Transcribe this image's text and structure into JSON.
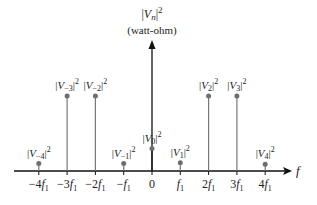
{
  "chart_data": {
    "type": "stem",
    "title": "",
    "ylabel": "|V_n|^2",
    "yunit": "(watt-ohm)",
    "xlabel": "f",
    "categories": [
      "-4f1",
      "-3f1",
      "-2f1",
      "-f1",
      "0",
      "f1",
      "2f1",
      "3f1",
      "4f1"
    ],
    "tick_labels": [
      "−4",
      "−3",
      "−2",
      "−",
      "0",
      "",
      "2",
      "3",
      "4"
    ],
    "point_labels": [
      "V−4",
      "V−3",
      "V−2",
      "V−1",
      "V0",
      "V1",
      "V2",
      "V3",
      "V4"
    ],
    "values": [
      0.1,
      1.0,
      1.0,
      0.1,
      0.3,
      0.11,
      1.0,
      1.0,
      0.09
    ],
    "grid": false,
    "legend": null
  },
  "labels": {
    "y_axis_symbol": "|V",
    "y_axis_sub": "n",
    "y_axis_sup": "2",
    "y_axis_unit": "(watt-ohm)",
    "x_axis": "f",
    "f_symbol": "f",
    "f_sub": "1"
  },
  "colors": {
    "stem": "#777777",
    "axis": "#111111",
    "dot": "#6e6e6e"
  }
}
